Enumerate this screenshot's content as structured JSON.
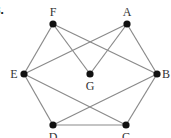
{
  "problem_number": "8.",
  "graph": {
    "nodes": [
      {
        "id": "F",
        "label": "F",
        "x": 53,
        "y": 24,
        "label_x": 53,
        "label_y": 16,
        "anchor": "middle"
      },
      {
        "id": "A",
        "label": "A",
        "x": 127,
        "y": 24,
        "label_x": 127,
        "label_y": 16,
        "anchor": "middle"
      },
      {
        "id": "E",
        "label": "E",
        "x": 24,
        "y": 74,
        "label_x": 14,
        "label_y": 78,
        "anchor": "middle"
      },
      {
        "id": "G",
        "label": "G",
        "x": 90,
        "y": 74,
        "label_x": 90,
        "label_y": 90,
        "anchor": "middle"
      },
      {
        "id": "B",
        "label": "B",
        "x": 157,
        "y": 74,
        "label_x": 166,
        "label_y": 78,
        "anchor": "middle"
      },
      {
        "id": "D",
        "label": "D",
        "x": 53,
        "y": 125,
        "label_x": 53,
        "label_y": 141,
        "anchor": "middle"
      },
      {
        "id": "C",
        "label": "C",
        "x": 126,
        "y": 125,
        "label_x": 126,
        "label_y": 141,
        "anchor": "middle"
      }
    ],
    "edges": [
      [
        "F",
        "E"
      ],
      [
        "F",
        "G"
      ],
      [
        "F",
        "B"
      ],
      [
        "A",
        "E"
      ],
      [
        "A",
        "G"
      ],
      [
        "A",
        "B"
      ],
      [
        "E",
        "D"
      ],
      [
        "E",
        "C"
      ],
      [
        "B",
        "D"
      ],
      [
        "B",
        "C"
      ],
      [
        "D",
        "C"
      ]
    ]
  },
  "colors": {
    "edge": "#8a8a8a",
    "node": "#111111",
    "label": "#333333"
  }
}
